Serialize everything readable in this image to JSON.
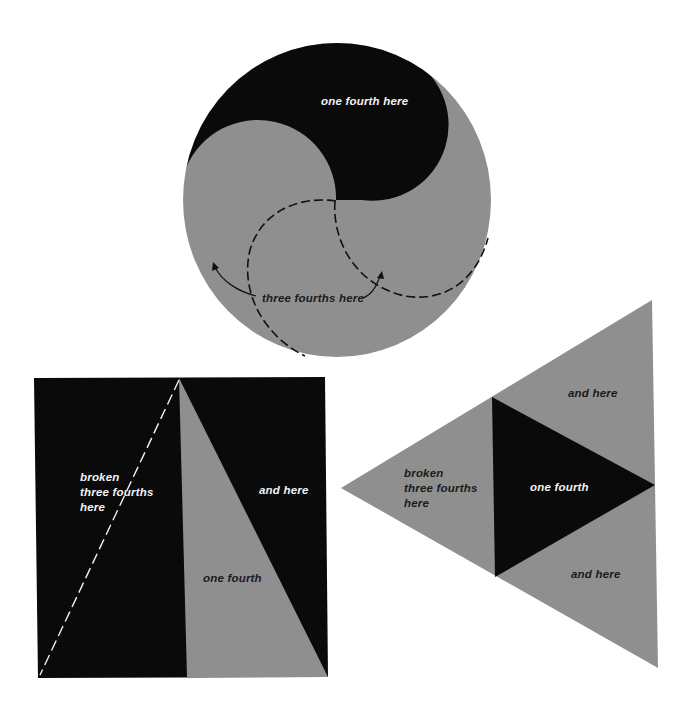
{
  "colors": {
    "background": "#ffffff",
    "gray": "#8f8f8f",
    "black": "#0a0a0a",
    "text_light": "#f2f2f2",
    "text_dark": "#1a1a1a"
  },
  "circle_figure": {
    "label_one_fourth": "one fourth here",
    "label_three_fourths": "three fourths here"
  },
  "square_figure": {
    "label_broken_lines": [
      "broken",
      "three fourths",
      "here"
    ],
    "label_and_here": "and here",
    "label_one_fourth": "one fourth"
  },
  "triangle_figure": {
    "label_and_here_top": "and here",
    "label_broken_lines": [
      "broken",
      "three fourths",
      "here"
    ],
    "label_one_fourth": "one fourth",
    "label_and_here_bottom": "and here"
  }
}
